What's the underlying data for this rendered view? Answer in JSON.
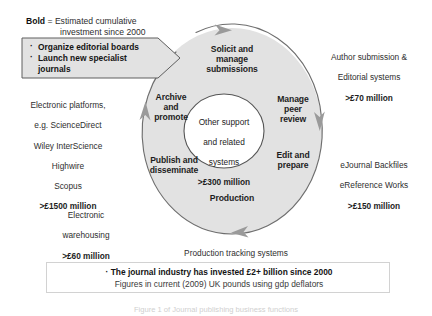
{
  "figure": {
    "type": "cycle-diagram",
    "title_legend": {
      "keyword": "Bold",
      "line1": " = Estimated cumulative",
      "line2": "investment since 2000"
    },
    "ring": {
      "fill_color": "#e3e3e3",
      "stroke_color": "#6b6b6b",
      "stages": [
        {
          "id": "solicit",
          "label": "Solicit and\nmanage\nsubmissions"
        },
        {
          "id": "peer",
          "label": "Manage\npeer\nreview"
        },
        {
          "id": "edit",
          "label": "Edit and\nprepare"
        },
        {
          "id": "production",
          "label": "Production"
        },
        {
          "id": "publish",
          "label": "Publish and\ndisseminate"
        },
        {
          "id": "archive",
          "label": "Archive\nand\npromote"
        }
      ]
    },
    "center": {
      "line1": "Other support",
      "line2": "and related",
      "line3": "systems",
      "amount": ">£300 million"
    },
    "callout": {
      "item1": "Organize editorial boards",
      "item2": "Launch new specialist",
      "item2_cont": "journals"
    },
    "annotations": [
      {
        "id": "author-submission",
        "lines": [
          "Author submission &",
          "Editorial systems"
        ],
        "amount": ">£70 million"
      },
      {
        "id": "ejournal-backfiles",
        "lines": [
          "eJournal Backfiles",
          "eReference Works"
        ],
        "amount": ">£150 million"
      },
      {
        "id": "production-tracking",
        "lines": [
          "Production tracking systems"
        ],
        "amount": ">£50 million"
      },
      {
        "id": "electronic-warehousing",
        "lines": [
          "Electronic",
          "warehousing"
        ],
        "amount": ">£60 million"
      },
      {
        "id": "electronic-platforms",
        "lines": [
          "Electronic platforms,",
          "e.g. ScienceDirect",
          "Wiley InterScience",
          "Highwire",
          "Scopus"
        ],
        "amount": ">£1500 million"
      }
    ],
    "summary": {
      "line1": "The journal industry has invested £2+ billion since 2000",
      "line2": "Figures in current (2009) UK pounds using gdp deflators"
    },
    "caption": "Figure 1 of Journal publishing business functions"
  }
}
